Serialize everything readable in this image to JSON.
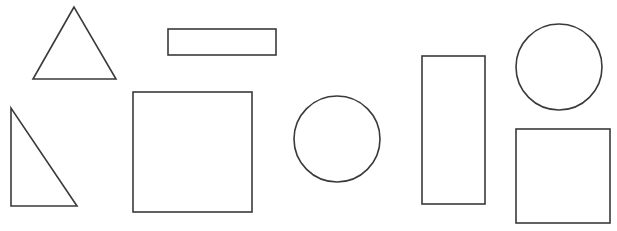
{
  "canvas": {
    "width": 617,
    "height": 231,
    "background": "#ffffff",
    "stroke": "#3a3a3a"
  },
  "shapes": [
    {
      "id": "triangle-equilateral",
      "type": "polygon",
      "points": "74,7 33,79 116,79"
    },
    {
      "id": "rectangle-horizontal",
      "type": "rect",
      "x": 168,
      "y": 29,
      "w": 108,
      "h": 26
    },
    {
      "id": "triangle-right",
      "type": "polygon",
      "points": "11,108 11,206 77,206"
    },
    {
      "id": "square-large",
      "type": "rect",
      "x": 133,
      "y": 92,
      "w": 119,
      "h": 120
    },
    {
      "id": "circle-middle",
      "type": "circle",
      "cx": 337,
      "cy": 139,
      "r": 43
    },
    {
      "id": "rectangle-vertical",
      "type": "rect",
      "x": 422,
      "y": 56,
      "w": 63,
      "h": 148
    },
    {
      "id": "circle-top-right",
      "type": "circle",
      "cx": 559,
      "cy": 67,
      "r": 43
    },
    {
      "id": "square-bottom-right",
      "type": "rect",
      "x": 516,
      "y": 129,
      "w": 94,
      "h": 94
    }
  ]
}
